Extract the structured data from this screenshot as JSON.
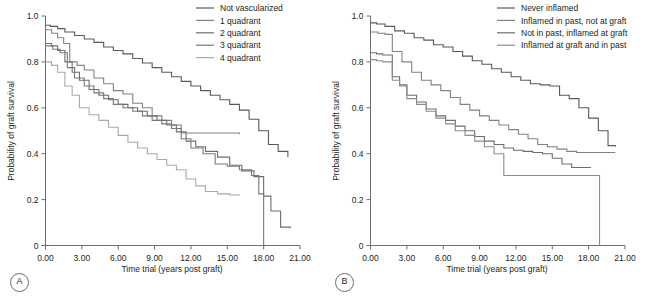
{
  "figure": {
    "panels": [
      {
        "letter": "A",
        "xlabel": "Time trial (years post graft)",
        "ylabel": "Probability of graft survival",
        "xticks": [
          "0.00",
          "3.00",
          "6.00",
          "9.00",
          "12.00",
          "15.00",
          "18.00",
          "21.00"
        ],
        "yticks": [
          "0",
          "0.2",
          "0.4",
          "0.6",
          "0.8",
          "1.0"
        ],
        "legend": [
          {
            "label": "Not vascularized",
            "color": "#58595b"
          },
          {
            "label": "1 quadrant",
            "color": "#808285"
          },
          {
            "label": "2 quadrant",
            "color": "#6d6e71"
          },
          {
            "label": "3 quadrant",
            "color": "#76787b"
          },
          {
            "label": "4 quadrant",
            "color": "#a7a9ac"
          }
        ]
      },
      {
        "letter": "B",
        "xlabel": "Time trial (years post graft)",
        "ylabel": "Probability of graft survival",
        "xticks": [
          "0.00",
          "3.00",
          "6.00",
          "9.00",
          "12.00",
          "15.00",
          "18.00",
          "21.00"
        ],
        "yticks": [
          "0",
          "0.2",
          "0.4",
          "0.6",
          "0.8",
          "1.0"
        ],
        "legend": [
          {
            "label": "Never inflamed",
            "color": "#58595b"
          },
          {
            "label": "Inflamed in past, not at graft",
            "color": "#808285"
          },
          {
            "label": "Not in past, inflamed at graft",
            "color": "#6d6e71"
          },
          {
            "label": "Inflamed at graft and in past",
            "color": "#8a8c8e"
          }
        ]
      }
    ]
  },
  "chart_data": [
    {
      "type": "line",
      "title": "",
      "panel": "A",
      "xlabel": "Time trial (years post graft)",
      "ylabel": "Probability of graft survival",
      "xlim": [
        0,
        21
      ],
      "ylim": [
        0,
        1.0
      ],
      "grid": false,
      "legend_position": "top-right",
      "step": "post",
      "series": [
        {
          "name": "Not vascularized",
          "color": "#58595b",
          "x": [
            0.0,
            0.4,
            1.0,
            1.6,
            2.4,
            3.2,
            4.0,
            4.8,
            5.6,
            6.4,
            7.2,
            8.0,
            8.8,
            9.6,
            10.4,
            11.2,
            12.0,
            12.8,
            13.6,
            14.4,
            15.2,
            16.0,
            16.8,
            17.6,
            18.4,
            19.2,
            20.0
          ],
          "y": [
            0.96,
            0.955,
            0.945,
            0.93,
            0.915,
            0.9,
            0.885,
            0.865,
            0.85,
            0.835,
            0.815,
            0.795,
            0.775,
            0.755,
            0.735,
            0.715,
            0.695,
            0.675,
            0.655,
            0.635,
            0.615,
            0.59,
            0.55,
            0.5,
            0.44,
            0.41,
            0.385
          ]
        },
        {
          "name": "1 quadrant",
          "color": "#808285",
          "x": [
            0.0,
            0.5,
            1.0,
            1.5,
            2.0,
            2.6,
            3.2,
            4.0,
            4.8,
            5.6,
            6.4,
            7.2,
            8.0,
            8.8,
            9.6,
            10.4,
            11.2,
            12.0,
            13.0,
            14.0,
            15.0,
            16.0
          ],
          "y": [
            0.94,
            0.925,
            0.905,
            0.88,
            0.8,
            0.785,
            0.765,
            0.73,
            0.705,
            0.675,
            0.66,
            0.62,
            0.6,
            0.565,
            0.545,
            0.525,
            0.49,
            0.49,
            0.49,
            0.49,
            0.49,
            0.485
          ]
        },
        {
          "name": "2 quadrant",
          "color": "#6d6e71",
          "x": [
            0.0,
            0.5,
            1.0,
            1.6,
            2.2,
            2.8,
            3.6,
            4.4,
            5.2,
            6.0,
            6.8,
            7.6,
            8.4,
            9.2,
            10.0,
            10.8,
            11.6,
            12.4,
            13.2,
            14.2,
            15.2,
            16.2,
            17.2,
            18.0,
            18.6,
            19.4,
            20.2
          ],
          "y": [
            0.88,
            0.87,
            0.85,
            0.8,
            0.755,
            0.72,
            0.68,
            0.655,
            0.635,
            0.615,
            0.6,
            0.585,
            0.565,
            0.545,
            0.525,
            0.495,
            0.455,
            0.43,
            0.41,
            0.385,
            0.35,
            0.325,
            0.3,
            0.215,
            0.15,
            0.08,
            0.075
          ]
        },
        {
          "name": "3 quadrant",
          "color": "#76787b",
          "x": [
            0.0,
            0.6,
            1.2,
            1.8,
            2.4,
            3.2,
            4.0,
            4.8,
            5.6,
            6.4,
            7.2,
            8.0,
            8.8,
            9.6,
            10.4,
            11.2,
            12.0,
            13.0,
            14.0,
            15.0,
            16.0,
            17.0,
            17.6,
            18.0
          ],
          "y": [
            0.87,
            0.855,
            0.84,
            0.775,
            0.73,
            0.695,
            0.665,
            0.64,
            0.615,
            0.6,
            0.585,
            0.565,
            0.545,
            0.53,
            0.51,
            0.465,
            0.425,
            0.4,
            0.355,
            0.345,
            0.33,
            0.305,
            0.225,
            0.0
          ]
        },
        {
          "name": "4 quadrant",
          "color": "#a7a9ac",
          "x": [
            0.0,
            0.5,
            1.0,
            1.6,
            2.2,
            2.8,
            3.6,
            4.4,
            5.2,
            6.0,
            6.8,
            7.6,
            8.4,
            9.2,
            10.0,
            10.8,
            11.6,
            12.4,
            13.2,
            14.2,
            15.2,
            16.0
          ],
          "y": [
            0.8,
            0.785,
            0.755,
            0.695,
            0.655,
            0.6,
            0.57,
            0.545,
            0.515,
            0.48,
            0.45,
            0.425,
            0.4,
            0.375,
            0.35,
            0.33,
            0.29,
            0.26,
            0.235,
            0.225,
            0.22,
            0.218
          ]
        }
      ]
    },
    {
      "type": "line",
      "title": "",
      "panel": "B",
      "xlabel": "Time trial (years post graft)",
      "ylabel": "Probability of graft survival",
      "xlim": [
        0,
        21
      ],
      "ylim": [
        0,
        1.0
      ],
      "grid": false,
      "legend_position": "top-right",
      "step": "post",
      "series": [
        {
          "name": "Never inflamed",
          "color": "#58595b",
          "x": [
            0.0,
            0.5,
            1.2,
            2.0,
            2.8,
            3.6,
            4.4,
            5.2,
            6.0,
            6.8,
            7.6,
            8.4,
            9.2,
            10.0,
            10.8,
            11.6,
            12.4,
            13.2,
            14.0,
            14.8,
            15.6,
            16.4,
            17.2,
            18.0,
            18.8,
            19.6,
            20.2
          ],
          "y": [
            0.97,
            0.965,
            0.955,
            0.935,
            0.925,
            0.905,
            0.895,
            0.875,
            0.865,
            0.845,
            0.825,
            0.805,
            0.79,
            0.77,
            0.755,
            0.735,
            0.72,
            0.705,
            0.7,
            0.695,
            0.655,
            0.64,
            0.6,
            0.555,
            0.5,
            0.435,
            0.43
          ]
        },
        {
          "name": "Inflamed in past, not at graft",
          "color": "#808285",
          "x": [
            0.0,
            0.6,
            1.2,
            1.8,
            2.6,
            3.4,
            4.2,
            5.0,
            5.8,
            6.6,
            7.4,
            8.2,
            9.0,
            9.8,
            10.6,
            11.4,
            12.2,
            13.0,
            13.8,
            14.6,
            15.4,
            16.2,
            17.0,
            17.8,
            18.6,
            19.4,
            20.2
          ],
          "y": [
            0.93,
            0.925,
            0.92,
            0.845,
            0.8,
            0.755,
            0.72,
            0.7,
            0.675,
            0.645,
            0.615,
            0.59,
            0.565,
            0.545,
            0.525,
            0.505,
            0.485,
            0.465,
            0.44,
            0.43,
            0.42,
            0.41,
            0.405,
            0.405,
            0.405,
            0.405,
            0.405
          ]
        },
        {
          "name": "Not in past, inflamed at graft",
          "color": "#6d6e71",
          "x": [
            0.0,
            0.5,
            1.0,
            1.8,
            2.4,
            3.0,
            3.8,
            4.6,
            5.4,
            6.2,
            7.0,
            7.8,
            8.6,
            9.4,
            10.2,
            11.0,
            11.8,
            12.6,
            13.4,
            14.2,
            15.0,
            15.8,
            16.6,
            17.4,
            18.2
          ],
          "y": [
            0.84,
            0.835,
            0.83,
            0.735,
            0.7,
            0.655,
            0.625,
            0.595,
            0.565,
            0.545,
            0.52,
            0.5,
            0.475,
            0.455,
            0.44,
            0.425,
            0.415,
            0.41,
            0.405,
            0.4,
            0.38,
            0.355,
            0.34,
            0.34,
            0.34
          ]
        },
        {
          "name": "Inflamed at graft and in past",
          "color": "#8a8c8e",
          "x": [
            0.0,
            0.5,
            1.0,
            1.8,
            2.4,
            3.0,
            3.8,
            4.6,
            5.4,
            6.2,
            7.0,
            7.8,
            8.6,
            9.4,
            10.2,
            11.0,
            18.8,
            18.9
          ],
          "y": [
            0.81,
            0.805,
            0.8,
            0.72,
            0.695,
            0.64,
            0.615,
            0.585,
            0.555,
            0.53,
            0.5,
            0.48,
            0.455,
            0.43,
            0.4,
            0.305,
            0.305,
            0.0
          ]
        }
      ]
    }
  ]
}
